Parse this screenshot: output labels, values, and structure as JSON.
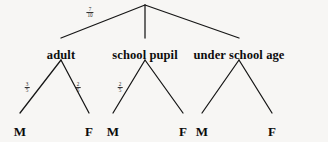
{
  "diagram": {
    "background_color": "#f7f6f4",
    "line_color": "#161616",
    "text_color": "#0d0d0d",
    "root": {
      "x": 145,
      "y": 5
    },
    "nodes": [
      {
        "id": "adult",
        "label": "adult",
        "x": 61,
        "y": 60,
        "label_y": 48
      },
      {
        "id": "school-pupil",
        "label": "school pupil",
        "x": 145,
        "y": 60,
        "label_y": 48
      },
      {
        "id": "under-school-age",
        "label": "under school age",
        "x": 239,
        "y": 60,
        "label_y": 48
      }
    ],
    "leaves": [
      {
        "id": "adult-m",
        "label": "M",
        "x": 20,
        "y": 124,
        "parent": "adult"
      },
      {
        "id": "adult-f",
        "label": "F",
        "x": 89,
        "y": 124,
        "parent": "adult"
      },
      {
        "id": "school-pupil-m",
        "label": "M",
        "x": 113,
        "y": 124,
        "parent": "school-pupil"
      },
      {
        "id": "school-pupil-f",
        "label": "F",
        "x": 183,
        "y": 124,
        "parent": "school-pupil"
      },
      {
        "id": "under-school-age-m",
        "label": "M",
        "x": 202,
        "y": 124,
        "parent": "under-school-age"
      },
      {
        "id": "under-school-age-f",
        "label": "F",
        "x": 272,
        "y": 124,
        "parent": "under-school-age"
      }
    ],
    "edge_labels": [
      {
        "id": "root-to-adult",
        "numerator": "7",
        "denominator": "10",
        "x": 90,
        "y": 13
      },
      {
        "id": "adult-to-m",
        "numerator": "3",
        "denominator": "5",
        "x": 27,
        "y": 88
      },
      {
        "id": "adult-to-f",
        "numerator": "2",
        "denominator": "5",
        "x": 78,
        "y": 88
      },
      {
        "id": "school-pupil-to-m",
        "numerator": "2",
        "denominator": "5",
        "x": 120,
        "y": 88
      }
    ]
  }
}
